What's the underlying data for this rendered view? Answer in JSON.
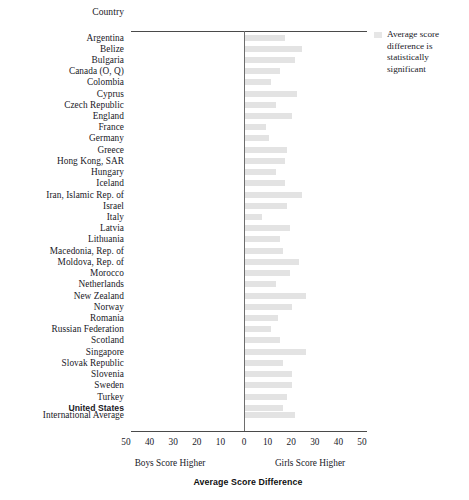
{
  "chart_data": {
    "type": "bar",
    "title": "",
    "xlabel": "Average Score Difference",
    "ylabel": "Country",
    "orientation": "horizontal",
    "xlim": [
      -50,
      50
    ],
    "xticks": [
      50,
      40,
      30,
      20,
      10,
      0,
      10,
      20,
      30,
      40,
      50
    ],
    "grid": false,
    "zero_reference": 0,
    "left_caption": "Boys Score Higher",
    "right_caption": "Girls Score Higher",
    "categories": [
      "Argentina",
      "Belize",
      "Bulgaria",
      "Canada (O, Q)",
      "Colombia",
      "Cyprus",
      "Czech Republic",
      "England",
      "France",
      "Germany",
      "Greece",
      "Hong Kong, SAR",
      "Hungary",
      "Iceland",
      "Iran, Islamic Rep. of",
      "Israel",
      "Italy",
      "Latvia",
      "Lithuania",
      "Macedonia, Rep. of",
      "Moldova, Rep. of",
      "Morocco",
      "Netherlands",
      "New Zealand",
      "Norway",
      "Romania",
      "Russian Federation",
      "Scotland",
      "Singapore",
      "Slovak Republic",
      "Slovenia",
      "Sweden",
      "Turkey",
      "United States",
      "International Average"
    ],
    "values": [
      17,
      24,
      21,
      15,
      11,
      22,
      13,
      20,
      9,
      10,
      18,
      17,
      13,
      17,
      24,
      18,
      7,
      19,
      15,
      16,
      23,
      19,
      13,
      26,
      20,
      14,
      11,
      15,
      26,
      16,
      20,
      20,
      18,
      16,
      21
    ],
    "significant": [
      true,
      true,
      true,
      true,
      true,
      true,
      true,
      true,
      true,
      true,
      true,
      true,
      true,
      true,
      true,
      true,
      true,
      true,
      true,
      true,
      true,
      true,
      true,
      true,
      true,
      true,
      true,
      true,
      true,
      true,
      true,
      true,
      true,
      true,
      true
    ],
    "legend_position": "right",
    "legend_entries": [
      "Average score difference is statistically significant"
    ]
  },
  "header": {
    "country_column_label": "Country"
  },
  "legend": {
    "swatch_name": "significance-swatch",
    "text": "Average score difference is statistically significant"
  },
  "axis": {
    "title": "Average Score Difference",
    "left_caption": "Boys Score Higher",
    "right_caption": "Girls Score Higher",
    "tick_labels": [
      "50",
      "40",
      "30",
      "20",
      "10",
      "0",
      "10",
      "20",
      "30",
      "40",
      "50"
    ]
  },
  "rows": [
    {
      "label": "Argentina",
      "value": 17,
      "significant": true,
      "bold": false
    },
    {
      "label": "Belize",
      "value": 24,
      "significant": true,
      "bold": false
    },
    {
      "label": "Bulgaria",
      "value": 21,
      "significant": true,
      "bold": false
    },
    {
      "label": "Canada (O, Q)",
      "value": 15,
      "significant": true,
      "bold": false
    },
    {
      "label": "Colombia",
      "value": 11,
      "significant": true,
      "bold": false
    },
    {
      "label": "Cyprus",
      "value": 22,
      "significant": true,
      "bold": false
    },
    {
      "label": "Czech Republic",
      "value": 13,
      "significant": true,
      "bold": false
    },
    {
      "label": "England",
      "value": 20,
      "significant": true,
      "bold": false
    },
    {
      "label": "France",
      "value": 9,
      "significant": true,
      "bold": false
    },
    {
      "label": "Germany",
      "value": 10,
      "significant": true,
      "bold": false
    },
    {
      "label": "Greece",
      "value": 18,
      "significant": true,
      "bold": false
    },
    {
      "label": "Hong Kong, SAR",
      "value": 17,
      "significant": true,
      "bold": false
    },
    {
      "label": "Hungary",
      "value": 13,
      "significant": true,
      "bold": false
    },
    {
      "label": "Iceland",
      "value": 17,
      "significant": true,
      "bold": false
    },
    {
      "label": "Iran, Islamic Rep. of",
      "value": 24,
      "significant": true,
      "bold": false
    },
    {
      "label": "Israel",
      "value": 18,
      "significant": true,
      "bold": false
    },
    {
      "label": "Italy",
      "value": 7,
      "significant": true,
      "bold": false
    },
    {
      "label": "Latvia",
      "value": 19,
      "significant": true,
      "bold": false
    },
    {
      "label": "Lithuania",
      "value": 15,
      "significant": true,
      "bold": false
    },
    {
      "label": "Macedonia, Rep. of",
      "value": 16,
      "significant": true,
      "bold": false
    },
    {
      "label": "Moldova, Rep. of",
      "value": 23,
      "significant": true,
      "bold": false
    },
    {
      "label": "Morocco",
      "value": 19,
      "significant": true,
      "bold": false
    },
    {
      "label": "Netherlands",
      "value": 13,
      "significant": true,
      "bold": false
    },
    {
      "label": "New Zealand",
      "value": 26,
      "significant": true,
      "bold": false
    },
    {
      "label": "Norway",
      "value": 20,
      "significant": true,
      "bold": false
    },
    {
      "label": "Romania",
      "value": 14,
      "significant": true,
      "bold": false
    },
    {
      "label": "Russian Federation",
      "value": 11,
      "significant": true,
      "bold": false
    },
    {
      "label": "Scotland",
      "value": 15,
      "significant": true,
      "bold": false
    },
    {
      "label": "Singapore",
      "value": 26,
      "significant": true,
      "bold": false
    },
    {
      "label": "Slovak Republic",
      "value": 16,
      "significant": true,
      "bold": false
    },
    {
      "label": "Slovenia",
      "value": 20,
      "significant": true,
      "bold": false
    },
    {
      "label": "Sweden",
      "value": 20,
      "significant": true,
      "bold": false
    },
    {
      "label": "Turkey",
      "value": 18,
      "significant": true,
      "bold": false
    },
    {
      "label": "United States",
      "value": 16,
      "significant": true,
      "bold": true
    },
    {
      "label": "International Average",
      "value": 21,
      "significant": true,
      "bold": false
    }
  ],
  "colors": {
    "bar": "#e6e6e6",
    "rule": "#4a4a4a",
    "zero_line": "#6d6d6d",
    "text": "#20201f"
  },
  "geometry": {
    "header_label_y": 9,
    "top_rule_y": 31,
    "bottom_rule_y": 431,
    "first_row_y": 34,
    "row_step": 11.22,
    "intl_row_y": 411,
    "zero_x": 113,
    "px_per_unit": 2.36,
    "bar_height": 6
  }
}
